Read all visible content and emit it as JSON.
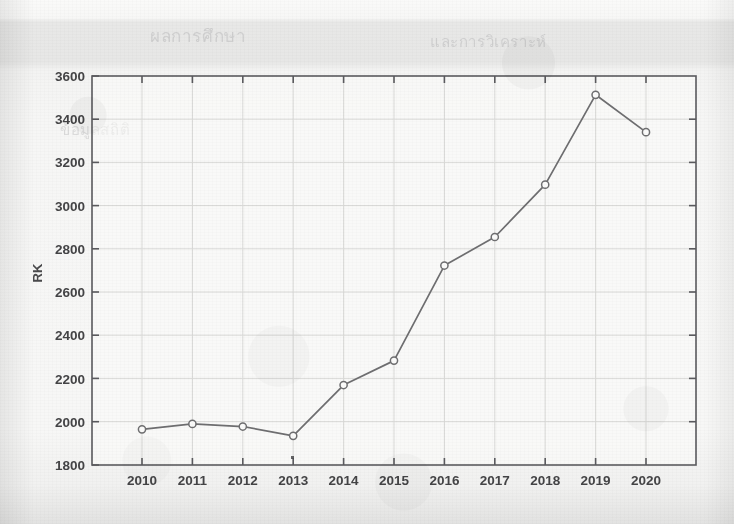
{
  "chart_data": {
    "type": "line",
    "title": "",
    "xlabel": "",
    "ylabel": "RK",
    "categories": [
      "2010",
      "2011",
      "2012",
      "2013",
      "2014",
      "2015",
      "2016",
      "2017",
      "2018",
      "2019",
      "2020"
    ],
    "values": [
      1965,
      1990,
      1978,
      1935,
      2170,
      2283,
      2723,
      2855,
      3097,
      3513,
      3340
    ],
    "series": [
      {
        "name": "RK",
        "values": [
          1965,
          1990,
          1978,
          1935,
          2170,
          2283,
          2723,
          2855,
          3097,
          3513,
          3340
        ]
      }
    ],
    "ylim": [
      1800,
      3600
    ],
    "ytick_step": 200,
    "yticks": [
      "1800",
      "2000",
      "2200",
      "2400",
      "2600",
      "2800",
      "3000",
      "3200",
      "3400",
      "3600"
    ],
    "xticks": [
      "2010",
      "2011",
      "2012",
      "2013",
      "2014",
      "2015",
      "2016",
      "2017",
      "2018",
      "2019",
      "2020"
    ],
    "grid": true,
    "legend": "none",
    "marker": "open-circle",
    "line_color": "#6e6e70",
    "marker_color": "#6e6e70",
    "grid_color": "#d8d8d6",
    "axis_color": "#55555a",
    "background_color": "#f4f4f3"
  },
  "figure": {
    "y_axis_title": "RK",
    "media": "scanned-photocopy",
    "ghost_text_lines": [
      "ผลการศึกษา",
      "และการวิเคราะห์",
      "ข้อมูลสถิติ"
    ]
  }
}
